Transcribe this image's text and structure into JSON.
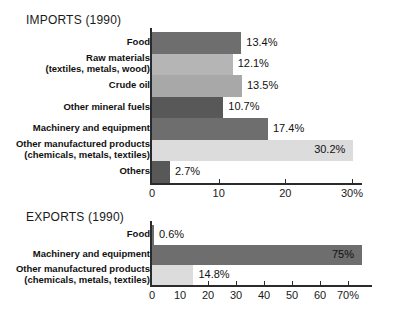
{
  "chart_data": [
    {
      "type": "bar",
      "orientation": "horizontal",
      "title": "IMPORTS (1990)",
      "xlabel": "",
      "ylabel": "",
      "xlim": [
        0,
        30
      ],
      "xticks": [
        0,
        10,
        20,
        30
      ],
      "xtick_labels": [
        "0",
        "10",
        "20",
        "30%"
      ],
      "grid": false,
      "legend": "none",
      "categories": [
        "Food",
        "Raw materials\n(textiles, metals, wood)",
        "Crude oil",
        "Other mineral fuels",
        "Machinery and equipment",
        "Other manufactured products\n(chemicals, metals, textiles)",
        "Others"
      ],
      "values": [
        13.4,
        12.1,
        13.5,
        10.7,
        17.4,
        30.2,
        2.7
      ],
      "value_labels": [
        "13.4%",
        "12.1%",
        "13.5%",
        "10.7%",
        "17.4%",
        "30.2%",
        "2.7%"
      ],
      "bar_colors": [
        "#6e6e6e",
        "#b5b5b5",
        "#a8a8a8",
        "#585858",
        "#6e6e6e",
        "#dcdcdc",
        "#585858"
      ]
    },
    {
      "type": "bar",
      "orientation": "horizontal",
      "title": "EXPORTS (1990)",
      "xlabel": "",
      "ylabel": "",
      "xlim": [
        0,
        70
      ],
      "xticks": [
        0,
        10,
        20,
        30,
        40,
        50,
        60,
        70
      ],
      "xtick_labels": [
        "0",
        "10",
        "20",
        "30",
        "40",
        "50",
        "60",
        "70%"
      ],
      "grid": false,
      "legend": "none",
      "categories": [
        "Food",
        "Machinery and equipment",
        "Other manufactured products\n(chemicals, metals, textiles)"
      ],
      "values": [
        0.6,
        75,
        14.8
      ],
      "value_labels": [
        "0.6%",
        "75%",
        "14.8%"
      ],
      "bar_colors": [
        "#6e6e6e",
        "#6e6e6e",
        "#dcdcdc"
      ]
    }
  ],
  "imports": {
    "title": "IMPORTS (1990)",
    "ticks": [
      {
        "label": "0"
      },
      {
        "label": "10"
      },
      {
        "label": "20"
      },
      {
        "label": "30%"
      }
    ],
    "rows": [
      {
        "label": "Food",
        "value_label": "13.4%"
      },
      {
        "label": "Raw materials\n(textiles, metals, wood)",
        "value_label": "12.1%"
      },
      {
        "label": "Crude oil",
        "value_label": "13.5%"
      },
      {
        "label": "Other mineral fuels",
        "value_label": "10.7%"
      },
      {
        "label": "Machinery and equipment",
        "value_label": "17.4%"
      },
      {
        "label": "Other manufactured products\n(chemicals, metals, textiles)",
        "value_label": "30.2%"
      },
      {
        "label": "Others",
        "value_label": "2.7%"
      }
    ]
  },
  "exports": {
    "title": "EXPORTS (1990)",
    "ticks": [
      {
        "label": "0"
      },
      {
        "label": "10"
      },
      {
        "label": "20"
      },
      {
        "label": "30"
      },
      {
        "label": "40"
      },
      {
        "label": "50"
      },
      {
        "label": "60"
      },
      {
        "label": "70%"
      }
    ],
    "rows": [
      {
        "label": "Food",
        "value_label": "0.6%"
      },
      {
        "label": "Machinery and equipment",
        "value_label": "75%"
      },
      {
        "label": "Other manufactured products\n(chemicals, metals, textiles)",
        "value_label": "14.8%"
      }
    ]
  }
}
